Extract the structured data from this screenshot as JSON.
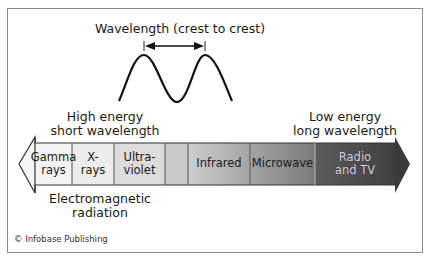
{
  "diagram": {
    "title": "Wavelength (crest to crest)",
    "high_energy": {
      "line1": "High energy",
      "line2": "short wavelength"
    },
    "low_energy": {
      "line1": "Low energy",
      "line2": "long wavelength"
    },
    "caption": {
      "line1": "Electromagnetic",
      "line2": "radiation"
    },
    "bands": [
      {
        "line1": "Gamma",
        "line2": "rays",
        "color": "#f2f2f2"
      },
      {
        "line1": "X-",
        "line2": "rays",
        "color": "#ececec"
      },
      {
        "line1": "Ultra-",
        "line2": "violet",
        "color": "#dcdcdc"
      },
      {
        "line1": "",
        "line2": "",
        "color": "#c8c8c8"
      },
      {
        "line1": "Infrared",
        "line2": "",
        "color": "#a8a8a8"
      },
      {
        "line1": "Microwave",
        "line2": "",
        "color": "#858585"
      },
      {
        "line1": "Radio",
        "line2": "and TV",
        "color": "#4a4a4a"
      }
    ],
    "copyright": "© Infobase Publishing"
  }
}
